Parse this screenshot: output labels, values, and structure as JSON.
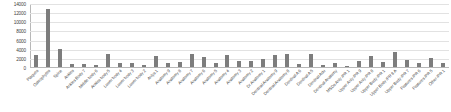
{
  "chart_data": {
    "type": "bar",
    "title": "",
    "subtitle": "",
    "xlabel": "",
    "ylabel": "",
    "ylim": [
      0,
      14000
    ],
    "yticks": [
      0,
      2000,
      4000,
      6000,
      8000,
      10000,
      12000,
      14000
    ],
    "ytick_labels": [
      "0",
      "2000",
      "4000",
      "6000",
      "8000",
      "10000",
      "12000",
      "14000"
    ],
    "grid": true,
    "legend": null,
    "series_color": "#7d7d7d",
    "categories": [
      "Plaques",
      "Osteophytes",
      "Spine",
      "Ankles",
      "Ankles Body 7",
      "Middle body 6",
      "Ankles body 5",
      "Lower body 4",
      "Lower body 3",
      "Lower body 2",
      "Anlys 1",
      "Anatomy 9",
      "Anatomy 8",
      "Anatomy 7",
      "Anatomy 6",
      "Anatomy 5",
      "Anatomy 4",
      "Anatomy 3",
      "Anatomy 2",
      "Dr Anatomy 1",
      "Dentinal Anatomy 9",
      "Dentinal Anatomy 8",
      "Dentinal A 6",
      "Dentinal A 5",
      "Dentinal Adu",
      "Dentinal Anatomy",
      "MSDs Anly /PR 1",
      "Upper Anly /PR 9",
      "Upper Anly /PR 8",
      "Upper Body /PR 1",
      "Upper Body /PR 8 A",
      "Upper Body /PR 7",
      "Features /PR 6",
      "Features /PR 5",
      "Other /PR 1"
    ],
    "values": [
      2700,
      13000,
      4000,
      700,
      600,
      400,
      3000,
      900,
      800,
      400,
      2500,
      900,
      1100,
      2900,
      2300,
      800,
      2600,
      1400,
      1300,
      1700,
      2700,
      3000,
      600,
      2900,
      500,
      1000,
      250,
      1400,
      2400,
      1200,
      3400,
      1500,
      900,
      2000,
      800
    ]
  }
}
